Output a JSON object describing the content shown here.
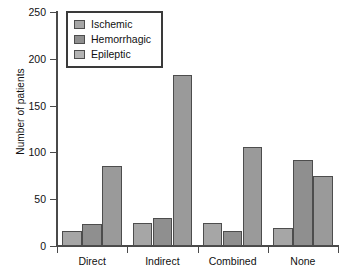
{
  "chart_data": {
    "type": "bar",
    "title": "",
    "xlabel": "",
    "ylabel": "Number of patients",
    "categories": [
      "Direct",
      "Indirect",
      "Combined",
      "None"
    ],
    "series": [
      {
        "name": "Ischemic",
        "values": [
          16,
          25,
          25,
          19
        ],
        "color": "#a6a6a6"
      },
      {
        "name": "Hemorrhagic",
        "values": [
          23,
          30,
          16,
          92
        ],
        "color": "#8f8f8f"
      },
      {
        "name": "Epileptic",
        "values": [
          85,
          183,
          106,
          75
        ],
        "color": "#9a9a9a"
      }
    ],
    "ylim": [
      0,
      250
    ],
    "yticks": [
      0,
      50,
      100,
      150,
      200,
      250
    ],
    "ytick_labels": [
      "0",
      "50",
      "100",
      "150",
      "200",
      "250"
    ],
    "grid": false,
    "legend_position": "top-left"
  }
}
